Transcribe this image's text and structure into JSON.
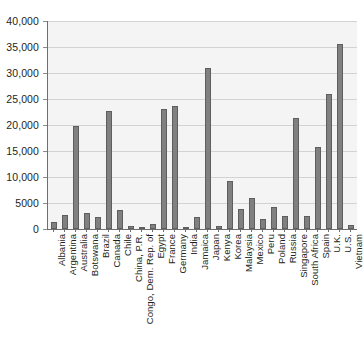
{
  "chart_data": {
    "type": "bar",
    "title": "",
    "subtitle": "",
    "xlabel": "",
    "ylabel": "",
    "ylim": [
      0,
      40000
    ],
    "yticks": [
      0,
      5000,
      10000,
      15000,
      20000,
      25000,
      30000,
      35000,
      40000
    ],
    "ytick_labels": [
      "0",
      "5000",
      "10,000",
      "15,000",
      "20,000",
      "25,000",
      "30,000",
      "35,000",
      "40,000"
    ],
    "grid": true,
    "legend": false,
    "legend_position": "none",
    "bar_color": "#808080",
    "bar_edge_color": "#5e5e5e",
    "plot_background": "#f4f4f4",
    "categories": [
      "Albania",
      "Argentina",
      "Australia",
      "Botswana",
      "Brazil",
      "Canada",
      "Chile",
      "China, P.R.",
      "Congo, Dem. Rep. of",
      "Egypt",
      "France",
      "Germany",
      "India",
      "Jamaica",
      "Japan",
      "Kenya",
      "Korea",
      "Malaysia",
      "Mexico",
      "Peru",
      "Poland",
      "Russia",
      "Singapore",
      "South Africa",
      "Spain",
      "U.K.",
      "U.S.",
      "Vietnam"
    ],
    "values": [
      1300,
      2600,
      19900,
      3100,
      2400,
      22700,
      3700,
      500,
      200,
      900,
      23000,
      23700,
      400,
      2400,
      30900,
      500,
      9200,
      3800,
      5900,
      1900,
      4300,
      2500,
      21400,
      2500,
      15700,
      25900,
      35500,
      700
    ]
  }
}
